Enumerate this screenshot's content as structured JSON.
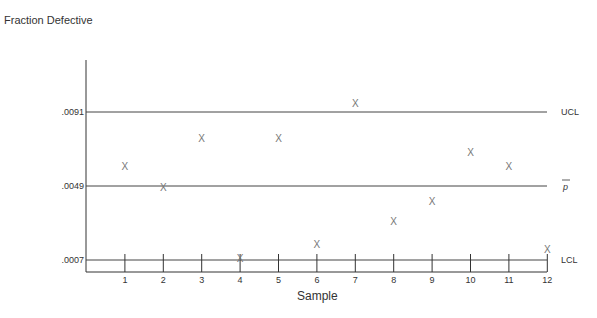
{
  "chart_data": {
    "type": "scatter",
    "subtype": "p-chart (control chart)",
    "title": "",
    "xlabel": "Sample",
    "ylabel": "Fraction Defective",
    "categories": [
      "1",
      "2",
      "3",
      "4",
      "5",
      "6",
      "7",
      "8",
      "9",
      "10",
      "11",
      "12"
    ],
    "series": [
      {
        "name": "Fraction Defective",
        "marker": "X",
        "x": [
          1,
          2,
          3,
          4,
          5,
          6,
          7,
          8,
          9,
          10,
          11,
          12
        ],
        "values": [
          0.006,
          0.0048,
          0.0076,
          0.0008,
          0.0076,
          0.0016,
          0.0096,
          0.0029,
          0.004,
          0.0068,
          0.006,
          0.0013
        ]
      }
    ],
    "control_lines": [
      {
        "name": "UCL",
        "value": 0.0091,
        "tick_label": ".0091"
      },
      {
        "name": "p-bar",
        "display": "p̄",
        "value": 0.0049,
        "tick_label": ".0049"
      },
      {
        "name": "LCL",
        "value": 0.0007,
        "tick_label": ".0007"
      }
    ],
    "y_ticks": [
      ".0091",
      ".0049",
      ".0007"
    ],
    "x_ticks": [
      "1",
      "2",
      "3",
      "4",
      "5",
      "6",
      "7",
      "8",
      "9",
      "10",
      "11",
      "12"
    ],
    "grid": false,
    "legend": "none"
  },
  "labels": {
    "ylabel": "Fraction Defective",
    "xlabel": "Sample",
    "ucl": "UCL",
    "pbar": "p",
    "lcl": "LCL",
    "ucl_tick": ".0091",
    "pbar_tick": ".0049",
    "lcl_tick": ".0007",
    "marker": "X"
  }
}
